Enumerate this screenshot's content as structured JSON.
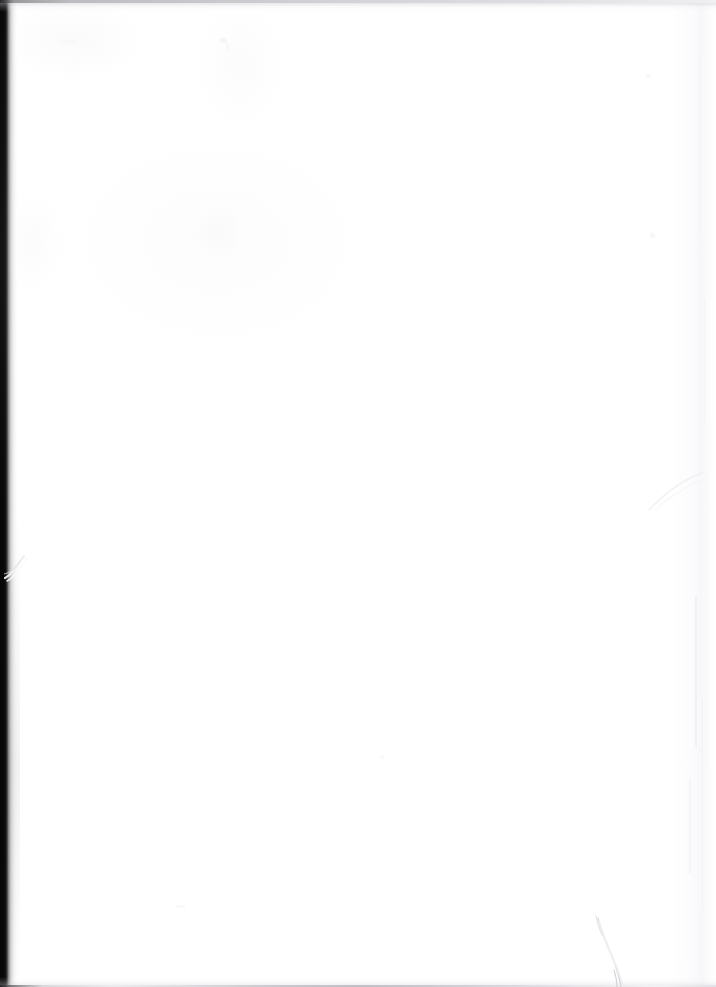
{
  "document": {
    "kind": "scanned-page",
    "content_state": "blank",
    "visible_text": "",
    "page_width": 716,
    "page_height": 987,
    "paper_color": "#ffffff",
    "background_color": "#ffffff"
  },
  "scan_artifacts": {
    "left_binding_shadow": {
      "name": "left-binding-shadow",
      "color": "#070707",
      "falloff_color": "#3a3a3a",
      "width_px": 7,
      "falloff_width_px": 11,
      "spans_full_height": true
    },
    "top_edge_line": {
      "name": "top-edge-line",
      "color": "#c2c2c6",
      "dark_end_color": "#2e2e30",
      "thickness_px": 3
    },
    "bottom_edge_line": {
      "name": "bottom-edge-line",
      "color": "#b9b9be",
      "dark_end_color": "#2a2a2c",
      "thickness_px": 2
    },
    "right_edge_streaks": {
      "name": "right-edge-streaks",
      "color": "#ececf0",
      "count": 6
    },
    "left_edge_nick": {
      "name": "left-edge-nick",
      "color": "#e9e9ec",
      "x": 4,
      "y": 548
    },
    "right_edge_arc": {
      "name": "right-edge-curl-arc",
      "color": "#eeeef1",
      "x": 648,
      "y": 470
    },
    "bottom_right_crease": {
      "name": "bottom-right-crease",
      "color": "#d9d9de",
      "x": 578,
      "y": 908
    },
    "specks": {
      "name": "dust-specks",
      "color": "#f3f3f5",
      "count": 7
    }
  }
}
